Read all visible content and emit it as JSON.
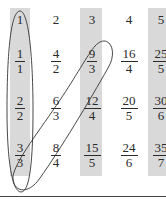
{
  "diagram": {
    "title": "",
    "shaded_columns": [
      0,
      2,
      4
    ],
    "shade_color": "#d9d9d9",
    "rows": [
      [
        {
          "type": "whole",
          "value": "1"
        },
        {
          "type": "whole",
          "value": "2"
        },
        {
          "type": "whole",
          "value": "3"
        },
        {
          "type": "whole",
          "value": "4"
        },
        {
          "type": "whole",
          "value": "5"
        }
      ],
      [
        {
          "type": "frac",
          "num": "1",
          "den": "1"
        },
        {
          "type": "frac",
          "num": "4",
          "den": "2"
        },
        {
          "type": "frac",
          "num": "9",
          "den": "3"
        },
        {
          "type": "frac",
          "num": "16",
          "den": "4"
        },
        {
          "type": "frac",
          "num": "25",
          "den": "5"
        }
      ],
      [
        {
          "type": "frac",
          "num": "2",
          "den": "2"
        },
        {
          "type": "frac",
          "num": "6",
          "den": "3"
        },
        {
          "type": "frac",
          "num": "12",
          "den": "4"
        },
        {
          "type": "frac",
          "num": "20",
          "den": "5"
        },
        {
          "type": "frac",
          "num": "30",
          "den": "6"
        }
      ],
      [
        {
          "type": "frac",
          "num": "3",
          "den": "3"
        },
        {
          "type": "frac",
          "num": "8",
          "den": "4"
        },
        {
          "type": "frac",
          "num": "15",
          "den": "5"
        },
        {
          "type": "frac",
          "num": "24",
          "den": "6"
        },
        {
          "type": "frac",
          "num": "35",
          "den": "7"
        }
      ]
    ],
    "loops": [
      {
        "name": "vertical-loop",
        "encloses": [
          "1",
          "1/1",
          "2/2",
          "3/3"
        ]
      },
      {
        "name": "diagonal-loop",
        "encloses": [
          "9/3",
          "6/3",
          "3/3"
        ]
      }
    ]
  }
}
